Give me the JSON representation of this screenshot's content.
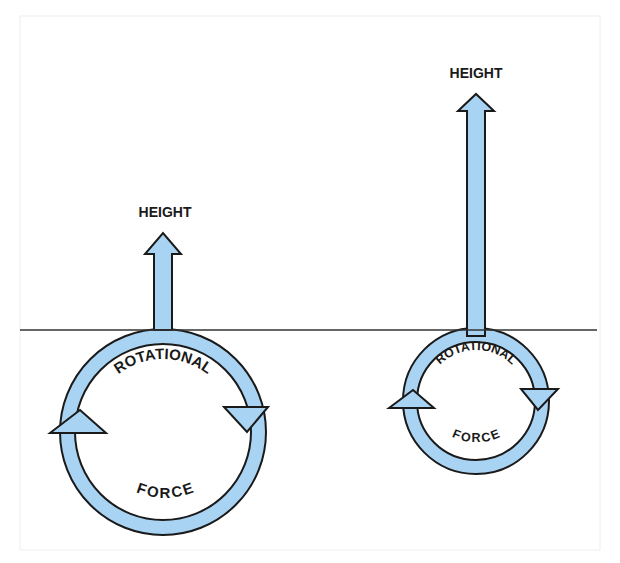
{
  "diagram": {
    "colors": {
      "arrow_fill": "#a9d3f2",
      "outline": "#1a1a1a",
      "ground_line": "#333333",
      "frame": "#eeeeee",
      "background": "#ffffff"
    },
    "ground_line": {
      "y": 330,
      "x_start": 20,
      "x_end": 597
    },
    "figures": [
      {
        "id": "left",
        "height_label": "HEIGHT",
        "ring_top_label": "ROTATIONAL",
        "ring_bottom_label": "FORCE",
        "circle": {
          "cx": 163,
          "cy": 432,
          "outer_r": 103,
          "inner_r": 88
        },
        "height_arrow": {
          "x": 163,
          "tip_y": 232,
          "base_y": 330
        }
      },
      {
        "id": "right",
        "height_label": "HEIGHT",
        "ring_top_label": "ROTATIONAL",
        "ring_bottom_label": "FORCE",
        "circle": {
          "cx": 476,
          "cy": 401,
          "outer_r": 73,
          "inner_r": 59
        },
        "height_arrow": {
          "x": 476,
          "tip_y": 94,
          "base_y": 330
        }
      }
    ]
  }
}
